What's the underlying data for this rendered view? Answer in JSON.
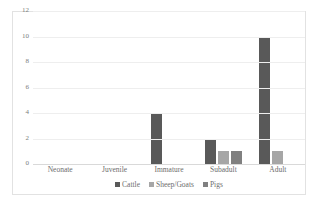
{
  "chart_data": {
    "type": "bar",
    "title": "",
    "subtitle": "",
    "xlabel": "",
    "ylabel": "",
    "categories": [
      "Neonate",
      "Juvenile",
      "Immature",
      "Subadult",
      "Adult"
    ],
    "series": [
      {
        "name": "Cattle",
        "color": "#595959",
        "values": [
          0,
          0,
          4,
          2,
          10
        ]
      },
      {
        "name": "Sheep/Goats",
        "color": "#a6a6a6",
        "values": [
          0,
          0,
          0,
          1,
          1
        ]
      },
      {
        "name": "Pigs",
        "color": "#808080",
        "values": [
          0,
          0,
          0,
          1,
          0
        ]
      }
    ],
    "ylim": [
      0,
      12
    ],
    "yticks": [
      0,
      2,
      4,
      6,
      8,
      10,
      12
    ],
    "ytick_labels": [
      "0",
      "2",
      "4",
      "6",
      "8",
      "10",
      "12"
    ],
    "grid": true,
    "grid_color": "#eeeeee",
    "legend_position": "bottom",
    "border_color": "#e2e2e2",
    "background": "#ffffff",
    "tick_label_color": "#6d6d6d"
  }
}
